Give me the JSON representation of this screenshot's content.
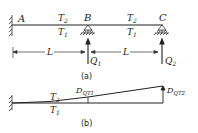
{
  "figure_a": {
    "caption": "(a)",
    "points": {
      "A": "A",
      "B": "B",
      "C": "C"
    },
    "span1_top": "T",
    "span1_top_sub": "2",
    "span1_bottom": "T",
    "span1_bottom_sub": "1",
    "span2_top": "T",
    "span2_top_sub": "2",
    "span2_bottom": "T",
    "span2_bottom_sub": "1",
    "length1": "L",
    "length2": "L",
    "load1": "Q",
    "load1_sub": "1",
    "load2": "Q",
    "load2_sub": "2"
  },
  "figure_b": {
    "caption": "(b)",
    "top": "T",
    "top_sub": "2",
    "bottom": "T",
    "bottom_sub": "1",
    "deflection1": "D",
    "deflection1_sub": "QT1",
    "deflection2": "D",
    "deflection2_sub": "QT2"
  }
}
